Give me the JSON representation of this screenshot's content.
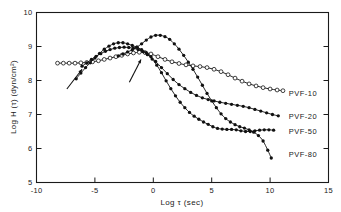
{
  "figure": {
    "background_color": "#ffffff",
    "ink_color": "#1a1a1a"
  },
  "chart_data": {
    "type": "line",
    "title": "",
    "subtitle": "",
    "xlabel": "Log τ (sec)",
    "ylabel": "Log H (τ) (dyn/cm²)",
    "xlim": [
      -10,
      15
    ],
    "ylim": [
      5,
      10
    ],
    "xticks": [
      -10,
      -5,
      0,
      5,
      10,
      15
    ],
    "xticklabels": [
      "-10",
      "-5",
      "0",
      "5",
      "10",
      "15"
    ],
    "yticks": [
      5,
      6,
      7,
      8,
      9,
      10
    ],
    "yticklabels": [
      "5",
      "6",
      "7",
      "8",
      "9",
      "10"
    ],
    "grid": false,
    "legend_position": "inline-right-of-curve-ends",
    "annotations": [
      {
        "name": "arrow-left",
        "text": "",
        "x_tail": -7.4,
        "y_tail": 7.75,
        "x_head": -6.1,
        "y_head": 8.33
      },
      {
        "name": "arrow-right",
        "text": "",
        "x_tail": -2.05,
        "y_tail": 7.95,
        "x_head": -1.05,
        "y_head": 8.62
      }
    ],
    "series": [
      {
        "name": "PVF-10",
        "label": "PVF-10",
        "marker": "open-circle",
        "label_x": 11.6,
        "label_y": 7.62,
        "x": [
          -8.2,
          -7.7,
          -7.2,
          -6.7,
          -6.2,
          -5.7,
          -5.2,
          -4.7,
          -4.2,
          -3.7,
          -3.2,
          -2.7,
          -2.2,
          -1.7,
          -1.2,
          -0.7,
          -0.2,
          0.4,
          1.0,
          1.6,
          2.2,
          2.8,
          3.4,
          4.0,
          4.6,
          5.2,
          5.8,
          6.4,
          7.0,
          7.6,
          8.2,
          8.8,
          9.4,
          10.0,
          10.6,
          11.1
        ],
        "y": [
          8.51,
          8.51,
          8.51,
          8.51,
          8.52,
          8.53,
          8.55,
          8.58,
          8.62,
          8.66,
          8.7,
          8.74,
          8.78,
          8.81,
          8.83,
          8.82,
          8.78,
          8.7,
          8.62,
          8.55,
          8.5,
          8.46,
          8.43,
          8.41,
          8.38,
          8.33,
          8.26,
          8.17,
          8.07,
          7.98,
          7.9,
          7.84,
          7.79,
          7.75,
          7.72,
          7.7
        ]
      },
      {
        "name": "PVF-20",
        "label": "PVF-20",
        "marker": "filled-circle",
        "label_x": 11.6,
        "label_y": 6.95,
        "x": [
          -6.6,
          -6.2,
          -5.8,
          -5.4,
          -5.0,
          -4.6,
          -4.2,
          -3.8,
          -3.4,
          -3.0,
          -2.6,
          -2.2,
          -1.8,
          -1.4,
          -1.0,
          -0.6,
          -0.2,
          0.2,
          0.7,
          1.2,
          1.7,
          2.2,
          2.7,
          3.2,
          3.7,
          4.2,
          4.7,
          5.2,
          5.7,
          6.2,
          6.7,
          7.2,
          7.7,
          8.2,
          8.7,
          9.2,
          9.7,
          10.2,
          10.7
        ],
        "y": [
          8.05,
          8.22,
          8.38,
          8.52,
          8.66,
          8.8,
          8.92,
          9.01,
          9.08,
          9.11,
          9.11,
          9.08,
          9.03,
          8.98,
          8.91,
          8.82,
          8.7,
          8.56,
          8.38,
          8.2,
          8.03,
          7.88,
          7.76,
          7.65,
          7.56,
          7.49,
          7.44,
          7.4,
          7.36,
          7.33,
          7.3,
          7.27,
          7.24,
          7.2,
          7.15,
          7.1,
          7.05,
          7.0,
          6.96
        ]
      },
      {
        "name": "PVF-50",
        "label": "PVF-50",
        "marker": "filled-circle",
        "label_x": 11.6,
        "label_y": 6.52,
        "x": [
          -6.1,
          -5.7,
          -5.3,
          -4.9,
          -4.5,
          -4.1,
          -3.7,
          -3.3,
          -2.9,
          -2.5,
          -2.1,
          -1.7,
          -1.3,
          -0.9,
          -0.5,
          -0.1,
          0.3,
          0.7,
          1.1,
          1.5,
          1.9,
          2.3,
          2.7,
          3.1,
          3.5,
          3.9,
          4.3,
          4.7,
          5.1,
          5.5,
          5.9,
          6.3,
          6.7,
          7.1,
          7.5,
          7.9,
          8.3,
          8.7,
          9.1,
          9.5,
          9.9,
          10.3
        ],
        "y": [
          8.42,
          8.52,
          8.62,
          8.71,
          8.79,
          8.86,
          8.91,
          8.95,
          8.97,
          8.98,
          8.97,
          8.95,
          8.91,
          8.85,
          8.76,
          8.63,
          8.45,
          8.23,
          7.99,
          7.76,
          7.55,
          7.36,
          7.2,
          7.06,
          6.95,
          6.86,
          6.78,
          6.71,
          6.64,
          6.59,
          6.57,
          6.56,
          6.56,
          6.55,
          6.52,
          6.5,
          6.5,
          6.52,
          6.54,
          6.55,
          6.55,
          6.54
        ]
      },
      {
        "name": "PVF-80",
        "label": "PVF-80",
        "marker": "filled-circle",
        "label_x": 11.6,
        "label_y": 5.82,
        "x": [
          -3.0,
          -2.6,
          -2.2,
          -1.8,
          -1.4,
          -1.0,
          -0.6,
          -0.2,
          0.2,
          0.6,
          1.0,
          1.4,
          1.8,
          2.2,
          2.6,
          3.0,
          3.4,
          3.8,
          4.2,
          4.6,
          5.0,
          5.4,
          5.8,
          6.2,
          6.6,
          7.0,
          7.4,
          7.8,
          8.2,
          8.6,
          9.0,
          9.4,
          9.8,
          10.1
        ],
        "y": [
          8.72,
          8.78,
          8.84,
          8.9,
          8.98,
          9.08,
          9.19,
          9.28,
          9.33,
          9.33,
          9.29,
          9.21,
          9.08,
          8.92,
          8.74,
          8.54,
          8.33,
          8.1,
          7.86,
          7.62,
          7.4,
          7.2,
          7.02,
          6.88,
          6.78,
          6.7,
          6.64,
          6.6,
          6.55,
          6.48,
          6.38,
          6.22,
          5.95,
          5.72
        ]
      }
    ]
  }
}
